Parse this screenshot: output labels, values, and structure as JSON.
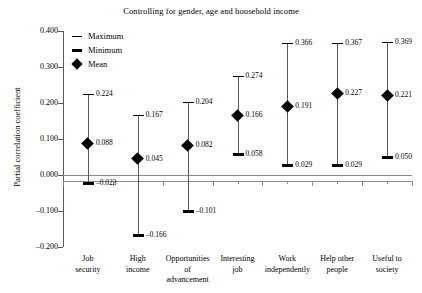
{
  "chart_data": {
    "type": "scatter",
    "title": "Controlling for gender, age and household income",
    "xlabel": "",
    "ylabel": "Partial correlation coefficient",
    "ylim": [
      -0.2,
      0.4
    ],
    "yticks": [
      "0.400",
      "0.300",
      "0.200",
      "0.100",
      "0.000",
      "-0.100",
      "-0.200"
    ],
    "grid": false,
    "legend_position": "top-left",
    "legend": [
      {
        "label": "Maximum",
        "marker": "thin-dash"
      },
      {
        "label": "Minimum",
        "marker": "thick-dash"
      },
      {
        "label": "Mean",
        "marker": "diamond"
      }
    ],
    "categories": [
      "Job\nsecurity",
      "High\nincome",
      "Opportunities\nof\nadvancement",
      "Interesting\njob",
      "Work\nindependently",
      "Help other\npeople",
      "Useful to\nsociety"
    ],
    "series": [
      {
        "name": "Maximum",
        "values": [
          0.224,
          0.167,
          0.204,
          0.274,
          0.366,
          0.367,
          0.369
        ]
      },
      {
        "name": "Mean",
        "values": [
          0.088,
          0.045,
          0.082,
          0.166,
          0.191,
          0.227,
          0.221
        ]
      },
      {
        "name": "Minimum",
        "values": [
          -0.023,
          -0.166,
          -0.101,
          0.058,
          0.029,
          0.029,
          0.05
        ]
      }
    ],
    "point_labels": {
      "maximum": [
        "0.224",
        "0.167",
        "0.204",
        "0.274",
        "0.366",
        "0.367",
        "0.369"
      ],
      "mean": [
        "0.088",
        "0.045",
        "0.082",
        "0.166",
        "0.191",
        "0.227",
        "0.221"
      ],
      "minimum": [
        "–0.023",
        "–0.166",
        "–0.101",
        "0.058",
        "0.029",
        "0.029",
        "0.050"
      ]
    },
    "colors": {
      "marker": "#000000",
      "stem": "#5a5a5a",
      "axis": "#8a8a8a",
      "background": "#ffffff"
    }
  }
}
